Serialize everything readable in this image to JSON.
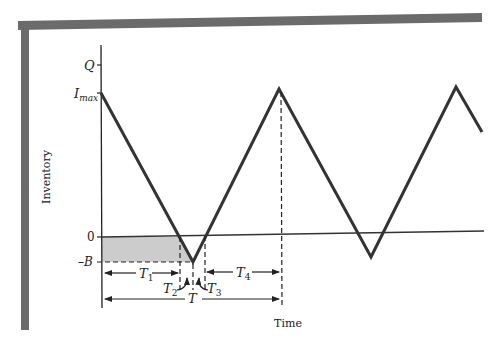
{
  "diagram": {
    "type": "inventory-with-backorders",
    "y_axis_label": "Inventory",
    "x_axis_label": "Time",
    "y_ticks": {
      "q": "Q",
      "imax_base": "I",
      "imax_sub": "max",
      "zero": "0",
      "neg_b": "–B"
    },
    "intervals": {
      "t1_base": "T",
      "t1_sub": "1",
      "t2_base": "T",
      "t2_sub": "2",
      "t3_base": "T",
      "t3_sub": "3",
      "t4_base": "T",
      "t4_sub": "4",
      "t_total": "T"
    },
    "colors": {
      "frame": "#6b6b6b",
      "line": "#333333",
      "shade": "#cccccc"
    }
  }
}
